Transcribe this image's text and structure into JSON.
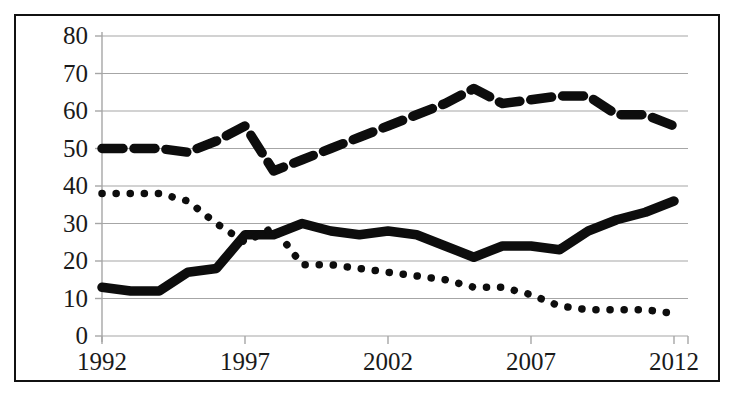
{
  "figure": {
    "clipped_title": "(......, ....)",
    "border_color": "#111111",
    "series_color": "#0d0d0d",
    "gridline_color": "#a6a6a6"
  },
  "axes": {
    "y_ticks": [
      "0",
      "10",
      "20",
      "30",
      "40",
      "50",
      "60",
      "70",
      "80"
    ],
    "x_ticks": [
      "1992",
      "1997",
      "2002",
      "2007",
      "2012"
    ]
  },
  "chart_data": {
    "type": "line",
    "title": "",
    "xlabel": "",
    "ylabel": "",
    "xlim": [
      1992,
      2012
    ],
    "ylim": [
      0,
      80
    ],
    "grid": true,
    "legend": "none",
    "x": [
      1992,
      1993,
      1994,
      1995,
      1996,
      1997,
      1998,
      1999,
      2000,
      2001,
      2002,
      2003,
      2004,
      2005,
      2006,
      2007,
      2008,
      2009,
      2010,
      2011,
      2012
    ],
    "series": [
      {
        "name": "dashed-series",
        "style": "dashed",
        "values": [
          50,
          50,
          50,
          49,
          52,
          56,
          44,
          47,
          50,
          53,
          56,
          59,
          62,
          66,
          62,
          63,
          64,
          64,
          59,
          59,
          56
        ]
      },
      {
        "name": "solid-series",
        "style": "solid",
        "values": [
          13,
          12,
          12,
          17,
          18,
          27,
          27,
          30,
          28,
          27,
          28,
          27,
          24,
          21,
          24,
          24,
          23,
          28,
          31,
          33,
          36
        ]
      },
      {
        "name": "dotted-series",
        "style": "dotted",
        "values": [
          38,
          38,
          38,
          36,
          30,
          25,
          29,
          19,
          19,
          18,
          17,
          16,
          15,
          13,
          13,
          11,
          8,
          7,
          7,
          7,
          6
        ]
      }
    ]
  }
}
